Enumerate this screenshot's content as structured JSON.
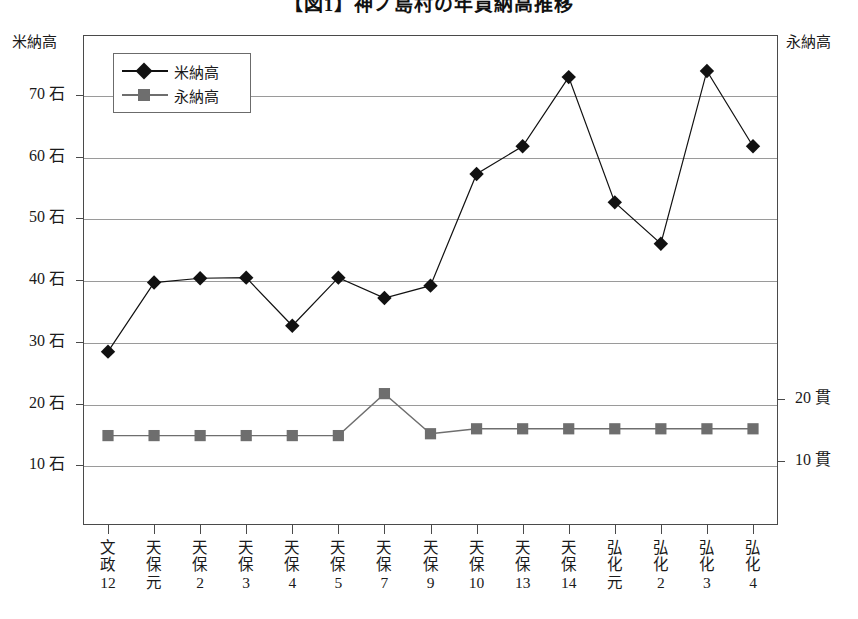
{
  "title": "【図1】神ノ島村の年貢納高推移",
  "axes": {
    "left_title": "米納高",
    "right_title": "永納高",
    "left_ticks": [
      "70 石",
      "60 石",
      "50 石",
      "40 石",
      "30 石",
      "20 石",
      "10 石"
    ],
    "right_ticks": [
      "20 貫",
      "10 貫"
    ]
  },
  "legend": {
    "items": [
      {
        "label": "米納高",
        "marker": "diamond",
        "color": "#111111"
      },
      {
        "label": "永納高",
        "marker": "square",
        "color": "#6e6e6e"
      }
    ]
  },
  "chart_data": {
    "type": "line",
    "title": "【図1】神ノ島村の年貢納高推移",
    "xlabel": "",
    "ylabel": "米納高",
    "y2label": "永納高",
    "grid": true,
    "legend_position": "top-left",
    "categories": [
      "文政12",
      "天保元",
      "天保2",
      "天保3",
      "天保4",
      "天保5",
      "天保7",
      "天保9",
      "天保10",
      "天保13",
      "天保14",
      "弘化元",
      "弘化2",
      "弘化3",
      "弘化4"
    ],
    "category_lines": [
      [
        "文",
        "政",
        "12"
      ],
      [
        "天",
        "保",
        "元"
      ],
      [
        "天",
        "保",
        "2"
      ],
      [
        "天",
        "保",
        "3"
      ],
      [
        "天",
        "保",
        "4"
      ],
      [
        "天",
        "保",
        "5"
      ],
      [
        "天",
        "保",
        "7"
      ],
      [
        "天",
        "保",
        "9"
      ],
      [
        "天",
        "保",
        "10"
      ],
      [
        "天",
        "保",
        "13"
      ],
      [
        "天",
        "保",
        "14"
      ],
      [
        "弘",
        "化",
        "元"
      ],
      [
        "弘",
        "化",
        "2"
      ],
      [
        "弘",
        "化",
        "3"
      ],
      [
        "弘",
        "化",
        "4"
      ]
    ],
    "series": [
      {
        "name": "米納高",
        "axis": "left",
        "unit": "石",
        "marker": "diamond",
        "color": "#111111",
        "values": [
          28.4,
          39.6,
          40.3,
          40.4,
          32.6,
          40.4,
          37.1,
          39.1,
          57.2,
          61.7,
          72.9,
          52.6,
          45.9,
          73.9,
          61.7
        ]
      },
      {
        "name": "永納高",
        "axis": "right",
        "unit": "貫",
        "marker": "square",
        "color": "#6e6e6e",
        "values": [
          14.8,
          14.8,
          14.8,
          14.8,
          14.8,
          14.8,
          21.6,
          15.1,
          15.9,
          15.9,
          15.9,
          15.9,
          15.9,
          15.9,
          15.9
        ]
      }
    ],
    "ylim": [
      5,
      77
    ],
    "y2lim": [
      5,
      77
    ],
    "ytick_values": [
      70,
      60,
      50,
      40,
      30,
      20,
      10
    ],
    "y2tick_values": [
      20,
      10
    ]
  }
}
